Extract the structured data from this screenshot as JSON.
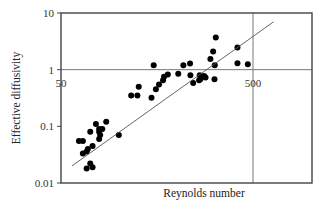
{
  "chart_data": {
    "type": "scatter",
    "title": "",
    "xlabel": "Reynolds number",
    "ylabel": "Effective diffusivity",
    "xscale": "log",
    "yscale": "log",
    "xlim": [
      50,
      1000
    ],
    "ylim": [
      0.01,
      10
    ],
    "x_tick_labels": [
      "50",
      "500"
    ],
    "y_tick_labels": [
      "10",
      "1",
      "0.1",
      "0.01"
    ],
    "gridlines": {
      "horizontal_at": [
        1
      ],
      "vertical_at": [
        500
      ]
    },
    "legend": null,
    "series": [
      {
        "name": "measurements",
        "marker": "filled-circle",
        "points": [
          {
            "x": 62,
            "y": 0.055
          },
          {
            "x": 65,
            "y": 0.055
          },
          {
            "x": 65,
            "y": 0.033
          },
          {
            "x": 68,
            "y": 0.036
          },
          {
            "x": 69,
            "y": 0.04
          },
          {
            "x": 71,
            "y": 0.08
          },
          {
            "x": 73,
            "y": 0.019
          },
          {
            "x": 73,
            "y": 0.045
          },
          {
            "x": 76,
            "y": 0.11
          },
          {
            "x": 79,
            "y": 0.09
          },
          {
            "x": 79,
            "y": 0.08
          },
          {
            "x": 79,
            "y": 0.06
          },
          {
            "x": 80,
            "y": 0.07
          },
          {
            "x": 82,
            "y": 0.09
          },
          {
            "x": 86,
            "y": 0.12
          },
          {
            "x": 100,
            "y": 0.07
          },
          {
            "x": 68,
            "y": 0.018
          },
          {
            "x": 71,
            "y": 0.022
          },
          {
            "x": 116,
            "y": 0.35
          },
          {
            "x": 125,
            "y": 0.35
          },
          {
            "x": 127,
            "y": 0.5
          },
          {
            "x": 152,
            "y": 1.2
          },
          {
            "x": 148,
            "y": 0.32
          },
          {
            "x": 156,
            "y": 0.45
          },
          {
            "x": 162,
            "y": 0.55
          },
          {
            "x": 170,
            "y": 0.65
          },
          {
            "x": 180,
            "y": 0.82
          },
          {
            "x": 172,
            "y": 0.75
          },
          {
            "x": 204,
            "y": 0.85
          },
          {
            "x": 217,
            "y": 1.2
          },
          {
            "x": 235,
            "y": 1.28
          },
          {
            "x": 236,
            "y": 0.8
          },
          {
            "x": 244,
            "y": 0.58
          },
          {
            "x": 264,
            "y": 0.8
          },
          {
            "x": 266,
            "y": 0.68
          },
          {
            "x": 262,
            "y": 0.65
          },
          {
            "x": 283,
            "y": 0.73
          },
          {
            "x": 278,
            "y": 0.77
          },
          {
            "x": 315,
            "y": 0.68
          },
          {
            "x": 310,
            "y": 2.1
          },
          {
            "x": 316,
            "y": 1.2
          },
          {
            "x": 300,
            "y": 1.55
          },
          {
            "x": 320,
            "y": 3.7
          },
          {
            "x": 415,
            "y": 2.45
          },
          {
            "x": 415,
            "y": 1.3
          },
          {
            "x": 470,
            "y": 1.25
          }
        ]
      },
      {
        "name": "fit",
        "type": "line",
        "points": [
          {
            "x": 57,
            "y": 0.02
          },
          {
            "x": 640,
            "y": 7.0
          }
        ]
      }
    ]
  },
  "axes": {
    "xlabel": "Reynolds number",
    "ylabel": "Effective diffusivity",
    "y_ticks": [
      {
        "label": "10",
        "value": 10
      },
      {
        "label": "1",
        "value": 1
      },
      {
        "label": "0.1",
        "value": 0.1
      },
      {
        "label": "0.01",
        "value": 0.01
      }
    ],
    "x_ticks": [
      {
        "label": "50",
        "value": 50
      },
      {
        "label": "500",
        "value": 500
      }
    ]
  }
}
